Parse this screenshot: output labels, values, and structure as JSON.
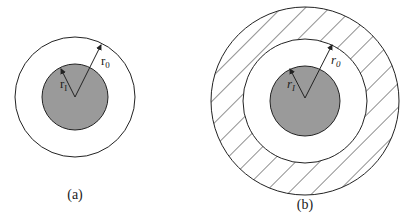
{
  "figure": {
    "panels": [
      {
        "id": "a",
        "caption": "(a)",
        "labels": {
          "outer_radius": "r",
          "outer_sub": "0",
          "inner_radius": "r",
          "inner_sub": "I"
        }
      },
      {
        "id": "b",
        "caption": "(b)",
        "labels": {
          "outer_radius": "r",
          "outer_sub": "0",
          "inner_radius": "r",
          "inner_sub": "I"
        }
      }
    ],
    "colors": {
      "core_fill": "#9a9a9a",
      "stroke": "#222222",
      "background": "#ffffff"
    }
  }
}
